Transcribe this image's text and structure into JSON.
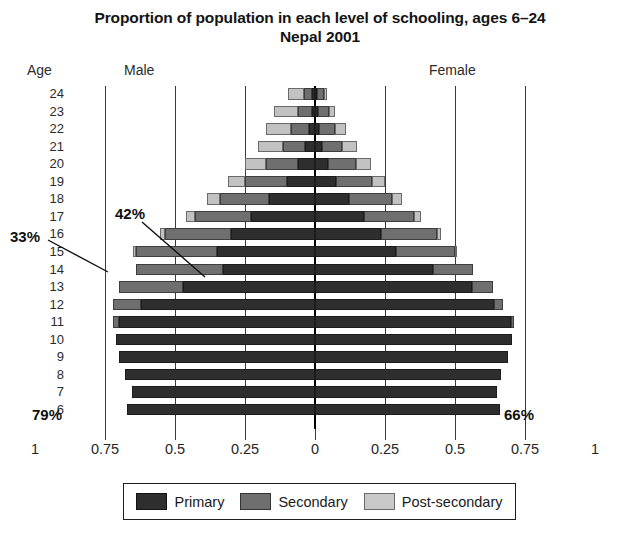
{
  "title": {
    "line1": "Proportion of population in each level of schooling, ages 6–24",
    "line2": "Nepal 2001"
  },
  "headers": {
    "age": "Age",
    "male": "Male",
    "female": "Female"
  },
  "axis": {
    "tick_labels": [
      "1",
      "0.75",
      "0.5",
      "0.25",
      "0",
      "0.25",
      "0.5",
      "0.75",
      "1"
    ],
    "tick_values": [
      -1,
      -0.75,
      -0.5,
      -0.25,
      0,
      0.25,
      0.5,
      0.75,
      1
    ],
    "gridline_values": [
      -0.75,
      -0.5,
      -0.25,
      0,
      0.25,
      0.5,
      0.75
    ]
  },
  "legend": {
    "items": [
      {
        "label": "Primary",
        "color": "#2e2e2e",
        "key": "primary"
      },
      {
        "label": "Secondary",
        "color": "#6f6f6f",
        "key": "secondary"
      },
      {
        "label": "Post-secondary",
        "color": "#c9c9c9",
        "key": "post"
      }
    ]
  },
  "annotations": [
    {
      "id": "pct-33",
      "text": "33%",
      "target_age": 14,
      "target_side": "male"
    },
    {
      "id": "pct-42",
      "text": "42%",
      "target_age": 14,
      "target_side": "female"
    },
    {
      "id": "pct-79",
      "text": "79%",
      "target_age": 6,
      "target_side": "male"
    },
    {
      "id": "pct-66",
      "text": "66%",
      "target_age": 6,
      "target_side": "female"
    }
  ],
  "chart_data": {
    "type": "bar",
    "subtype": "population-pyramid-stacked",
    "xlabel": "",
    "ylabel": "Age",
    "xlim": [
      -1,
      1
    ],
    "grid": true,
    "legend_position": "bottom",
    "categories": [
      24,
      23,
      22,
      21,
      20,
      19,
      18,
      17,
      16,
      15,
      14,
      13,
      12,
      11,
      10,
      9,
      8,
      7,
      6
    ],
    "series": [
      {
        "name": "Primary",
        "side": "male",
        "key": "male_primary",
        "values": [
          0.01,
          0.012,
          0.02,
          0.035,
          0.06,
          0.1,
          0.165,
          0.23,
          0.3,
          0.35,
          0.33,
          0.47,
          0.62,
          0.7,
          0.71,
          0.7,
          0.68,
          0.655,
          0.67
        ]
      },
      {
        "name": "Secondary",
        "side": "male",
        "key": "male_secondary",
        "values": [
          0.03,
          0.05,
          0.065,
          0.08,
          0.115,
          0.15,
          0.175,
          0.2,
          0.235,
          0.29,
          0.31,
          0.23,
          0.1,
          0.02,
          0.0,
          0.0,
          0.0,
          0.0,
          0.0
        ]
      },
      {
        "name": "Post-secondary",
        "side": "male",
        "key": "male_post",
        "values": [
          0.055,
          0.085,
          0.09,
          0.09,
          0.075,
          0.06,
          0.045,
          0.03,
          0.02,
          0.01,
          0.0,
          0.0,
          0.0,
          0.0,
          0.0,
          0.0,
          0.0,
          0.0,
          0.0
        ]
      },
      {
        "name": "Primary",
        "side": "female",
        "key": "female_primary",
        "values": [
          0.008,
          0.01,
          0.015,
          0.025,
          0.045,
          0.075,
          0.12,
          0.175,
          0.235,
          0.29,
          0.42,
          0.56,
          0.64,
          0.7,
          0.705,
          0.69,
          0.665,
          0.65,
          0.66
        ]
      },
      {
        "name": "Secondary",
        "side": "female",
        "key": "female_secondary",
        "values": [
          0.025,
          0.04,
          0.055,
          0.07,
          0.1,
          0.13,
          0.155,
          0.18,
          0.2,
          0.21,
          0.145,
          0.075,
          0.03,
          0.01,
          0.0,
          0.0,
          0.0,
          0.0,
          0.0
        ]
      },
      {
        "name": "Post-secondary",
        "side": "female",
        "key": "female_post",
        "values": [
          0.01,
          0.02,
          0.04,
          0.055,
          0.055,
          0.045,
          0.035,
          0.025,
          0.015,
          0.008,
          0.0,
          0.0,
          0.0,
          0.0,
          0.0,
          0.0,
          0.0,
          0.0,
          0.0
        ]
      }
    ],
    "callouts": [
      {
        "label": "33%",
        "age": 14,
        "side": "male",
        "value": 0.33
      },
      {
        "label": "42%",
        "age": 14,
        "side": "female",
        "value": 0.42
      },
      {
        "label": "79%",
        "age": 6,
        "side": "male",
        "value": 0.79
      },
      {
        "label": "66%",
        "age": 6,
        "side": "female",
        "value": 0.66
      }
    ]
  }
}
